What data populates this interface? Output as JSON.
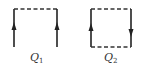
{
  "diagram": {
    "figures": [
      {
        "id": "Q1",
        "label": "Q",
        "subscript": "1",
        "description": "open loop: two solid vertical lines with upward arrows joined by dashed top edge",
        "edges": [
          {
            "side": "left",
            "style": "solid",
            "arrow": "up"
          },
          {
            "side": "top",
            "style": "dashed",
            "arrow": "none"
          },
          {
            "side": "right",
            "style": "solid",
            "arrow": "up"
          }
        ]
      },
      {
        "id": "Q2",
        "label": "Q",
        "subscript": "2",
        "description": "closed loop: solid left/right verticals with left arrow up and right arrow down, dashed top and bottom edges",
        "edges": [
          {
            "side": "left",
            "style": "solid",
            "arrow": "up"
          },
          {
            "side": "top",
            "style": "dashed",
            "arrow": "none"
          },
          {
            "side": "right",
            "style": "solid",
            "arrow": "down"
          },
          {
            "side": "bottom",
            "style": "dashed",
            "arrow": "none"
          }
        ]
      }
    ],
    "colors": {
      "line": "#222222",
      "dashed": "#333333",
      "label": "#333333",
      "background": "#ffffff"
    }
  }
}
